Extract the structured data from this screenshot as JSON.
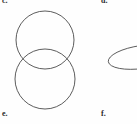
{
  "figure": {
    "background_color": "#fefefe",
    "stroke_color": "#4a4a4a",
    "panels": [
      {
        "id": "panel-c",
        "label": "c.",
        "position": "top-left",
        "clipped_by_top_edge": true,
        "shape_description": "two overlapping circles stacked vertically"
      },
      {
        "id": "panel-d",
        "label": "d.",
        "position": "top-right",
        "clipped_by_top_edge": true,
        "shape_description": "wide flat ellipse clipped by right edge"
      },
      {
        "id": "panel-e",
        "label": "e.",
        "position": "bottom-left",
        "clipped_by_top_edge": false,
        "shape_description": "label only"
      },
      {
        "id": "panel-f",
        "label": "f.",
        "position": "bottom-right",
        "clipped_by_top_edge": false,
        "shape_description": "label only"
      }
    ],
    "shapes": {
      "upper_circle": {
        "cx": 45,
        "cy": 40,
        "r": 29
      },
      "lower_circle": {
        "cx": 45,
        "cy": 79,
        "r": 30
      },
      "right_ellipse": {
        "cx": 142,
        "cy": 57,
        "rx": 34,
        "ry": 11.5,
        "rotation": -8
      }
    }
  }
}
